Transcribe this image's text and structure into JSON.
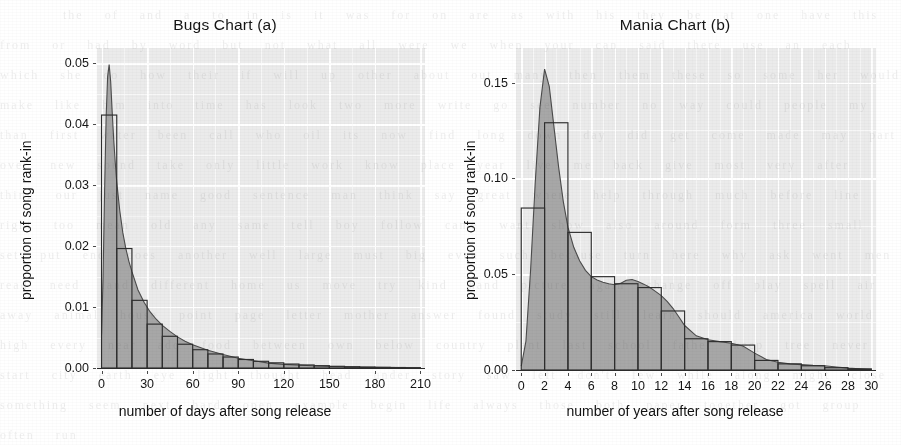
{
  "figure": {
    "background_color": "#ffffff",
    "panel_color": "#ebebeb",
    "grid_color": "#ffffff",
    "density_fill_color": "#a3a3a3",
    "histogram_stroke_color": "#2e2e2e"
  },
  "chart_data": [
    {
      "type": "bar",
      "id": "bugs",
      "title": "Bugs Chart (a)",
      "xlabel": "number of days after song release",
      "ylabel": "proportion of song rank-in",
      "xlim": [
        -3,
        213
      ],
      "ylim": [
        0,
        0.0525
      ],
      "xticks": [
        0,
        30,
        60,
        90,
        120,
        150,
        180,
        210
      ],
      "xtick_labels": [
        "0",
        "30",
        "60",
        "90",
        "120",
        "150",
        "180",
        "210"
      ],
      "yticks": [
        0.0,
        0.01,
        0.02,
        0.03,
        0.04,
        0.05
      ],
      "ytick_labels": [
        "0.00",
        "0.01",
        "0.02",
        "0.03",
        "0.04",
        "0.05"
      ],
      "grid": true,
      "legend": "none",
      "bin_width": 10,
      "bin_starts": [
        0,
        10,
        20,
        30,
        40,
        50,
        60,
        70,
        80,
        90,
        100,
        110,
        120,
        130,
        140,
        150,
        160,
        170,
        180,
        190,
        200
      ],
      "values": [
        0.0415,
        0.0196,
        0.0111,
        0.0072,
        0.0052,
        0.0039,
        0.003,
        0.0023,
        0.0018,
        0.0014,
        0.0011,
        0.00085,
        0.00065,
        0.0005,
        0.00038,
        0.00028,
        0.00021,
        0.00015,
        0.00011,
        8e-05,
        5e-05
      ],
      "density_x": [
        0,
        1,
        2,
        3,
        4,
        5,
        6,
        7,
        8,
        9,
        10,
        12,
        14,
        16,
        18,
        20,
        24,
        28,
        32,
        36,
        40,
        45,
        50,
        55,
        60,
        70,
        80,
        90,
        100,
        110,
        120,
        135,
        150,
        165,
        180,
        195,
        210
      ],
      "density_y": [
        0.0055,
        0.015,
        0.029,
        0.041,
        0.0478,
        0.0498,
        0.047,
        0.042,
        0.0375,
        0.0338,
        0.0305,
        0.0258,
        0.0222,
        0.0196,
        0.0175,
        0.0158,
        0.0128,
        0.0108,
        0.0092,
        0.008,
        0.007,
        0.006,
        0.0051,
        0.0044,
        0.0038,
        0.0029,
        0.0022,
        0.0016,
        0.0012,
        0.0008,
        0.0006,
        0.0004,
        0.00025,
        0.00016,
        0.0001,
        6e-05,
        3e-05
      ]
    },
    {
      "type": "bar",
      "id": "mania",
      "title": "Mania Chart (b)",
      "xlabel": "number of years after song release",
      "ylabel": "proportion of song rank-in",
      "xlim": [
        -0.45,
        30.4
      ],
      "ylim": [
        0,
        0.168
      ],
      "xticks": [
        0,
        2,
        4,
        6,
        8,
        10,
        12,
        14,
        16,
        18,
        20,
        22,
        24,
        26,
        28,
        30
      ],
      "xtick_labels": [
        "0",
        "2",
        "4",
        "6",
        "8",
        "10",
        "12",
        "14",
        "16",
        "18",
        "20",
        "22",
        "24",
        "26",
        "28",
        "30"
      ],
      "yticks": [
        0.0,
        0.05,
        0.1,
        0.15
      ],
      "ytick_labels": [
        "0.00",
        "0.05",
        "0.10",
        "0.15"
      ],
      "grid": true,
      "legend": "none",
      "bin_width": 2,
      "bin_starts": [
        0,
        2,
        4,
        6,
        8,
        10,
        12,
        14,
        16,
        18,
        20,
        22,
        24,
        26,
        28
      ],
      "values": [
        0.0845,
        0.129,
        0.0718,
        0.0487,
        0.045,
        0.043,
        0.0308,
        0.0163,
        0.0148,
        0.013,
        0.005,
        0.0032,
        0.0022,
        0.0012,
        0.0006
      ],
      "density_x": [
        0,
        0.4,
        0.8,
        1.2,
        1.6,
        2.0,
        2.4,
        2.8,
        3.2,
        3.6,
        4.0,
        4.5,
        5.0,
        5.5,
        6.0,
        6.5,
        7.0,
        7.5,
        8.0,
        8.5,
        9.0,
        9.5,
        10.0,
        10.5,
        11.0,
        11.5,
        12.0,
        12.5,
        13.0,
        13.5,
        14.0,
        15.0,
        16.0,
        17.0,
        18.0,
        19.0,
        20.0,
        21.0,
        22.0,
        23.0,
        24.0,
        25.0,
        26.0,
        27.0,
        28.0,
        29.0,
        30.0
      ],
      "density_y": [
        0.002,
        0.015,
        0.052,
        0.098,
        0.137,
        0.157,
        0.148,
        0.127,
        0.106,
        0.088,
        0.0745,
        0.064,
        0.057,
        0.052,
        0.0487,
        0.047,
        0.0458,
        0.045,
        0.0445,
        0.0452,
        0.0468,
        0.0472,
        0.0462,
        0.0448,
        0.0432,
        0.041,
        0.0388,
        0.0358,
        0.0322,
        0.0278,
        0.0232,
        0.0178,
        0.0158,
        0.0148,
        0.014,
        0.0125,
        0.0088,
        0.0055,
        0.004,
        0.0032,
        0.0028,
        0.0024,
        0.0022,
        0.0016,
        0.001,
        0.0006,
        0.0003
      ]
    }
  ]
}
